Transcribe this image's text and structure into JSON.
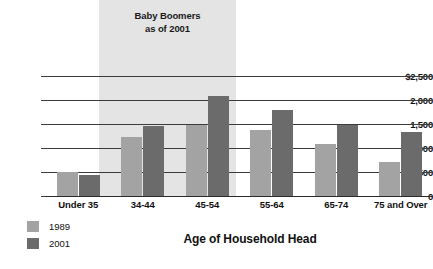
{
  "chart_data": {
    "type": "bar",
    "title": "",
    "xlabel": "Age of Household Head",
    "ylabel": "",
    "categories": [
      "Under 35",
      "34-44",
      "45-54",
      "55-64",
      "65-74",
      "75 and Over"
    ],
    "series": [
      {
        "name": "1989",
        "color": "#a3a3a3",
        "values": [
          500,
          1230,
          1480,
          1380,
          1090,
          700
        ]
      },
      {
        "name": "2001",
        "color": "#6b6b6b",
        "values": [
          440,
          1460,
          2080,
          1790,
          1480,
          1340
        ]
      }
    ],
    "ylim": [
      0,
      2500
    ],
    "yticks": [
      0,
      500,
      1000,
      1500,
      2000,
      2500
    ],
    "ytick_labels": [
      "0",
      "500",
      "1,000",
      "1,500",
      "2,000",
      "$2,500"
    ],
    "grid": true,
    "legend_position": "bottom-left",
    "annotations": [
      {
        "text": "Baby Boomers\nas of 2001",
        "line1": "Baby Boomers",
        "line2": "as of 2001",
        "covers_categories": [
          "34-44",
          "45-54"
        ],
        "band_color": "#e4e4e4"
      }
    ]
  },
  "legend": {
    "items": [
      {
        "label": "1989",
        "color": "#a3a3a3"
      },
      {
        "label": "2001",
        "color": "#6b6b6b"
      }
    ]
  }
}
